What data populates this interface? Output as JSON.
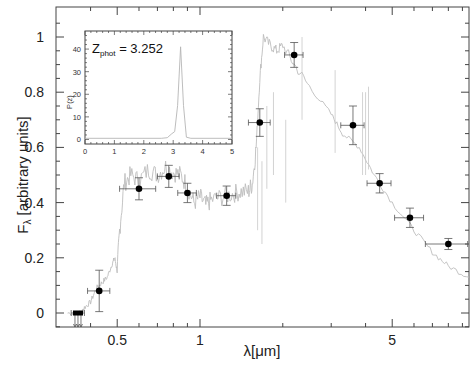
{
  "chart_data": {
    "type": "scatter",
    "title": "",
    "xlabel": "λ[μm]",
    "ylabel": "Fλ [arbitrary units]",
    "xscale": "log",
    "xlim": [
      0.3,
      9.5
    ],
    "ylim": [
      -0.05,
      1.08
    ],
    "x_ticks": [
      0.5,
      1,
      5
    ],
    "x_tick_labels": [
      "0.5",
      "1",
      "5"
    ],
    "y_ticks": [
      0,
      0.2,
      0.4,
      0.6,
      0.8,
      1
    ],
    "y_tick_labels": [
      "0",
      "0.2",
      "0.4",
      "0.6",
      "0.8",
      "1"
    ],
    "grid": false,
    "series": [
      {
        "name": "photometry",
        "style": "black points with error bars",
        "points": [
          {
            "x": 0.36,
            "y": 0.0,
            "xerr": 0.02,
            "yerr": 0.0,
            "upper_limit": true
          },
          {
            "x": 0.43,
            "y": 0.08,
            "xerr": 0.04,
            "yerr": 0.075
          },
          {
            "x": 0.6,
            "y": 0.45,
            "xerr": 0.09,
            "yerr": 0.04
          },
          {
            "x": 0.77,
            "y": 0.495,
            "xerr": 0.07,
            "yerr": 0.04
          },
          {
            "x": 0.9,
            "y": 0.435,
            "xerr": 0.07,
            "yerr": 0.035
          },
          {
            "x": 1.25,
            "y": 0.425,
            "xerr": 0.1,
            "yerr": 0.035
          },
          {
            "x": 1.65,
            "y": 0.69,
            "xerr": 0.15,
            "yerr": 0.05
          },
          {
            "x": 2.2,
            "y": 0.935,
            "xerr": 0.17,
            "yerr": 0.045
          },
          {
            "x": 3.6,
            "y": 0.68,
            "xerr": 0.35,
            "yerr": 0.07
          },
          {
            "x": 4.5,
            "y": 0.47,
            "xerr": 0.45,
            "yerr": 0.035
          },
          {
            "x": 5.8,
            "y": 0.345,
            "xerr": 0.7,
            "yerr": 0.035
          },
          {
            "x": 8.0,
            "y": 0.25,
            "xerr": 1.4,
            "yerr": 0.02
          }
        ]
      },
      {
        "name": "best-fit template spectrum",
        "style": "light gray line",
        "points": [
          [
            0.33,
            0.0
          ],
          [
            0.37,
            0.0
          ],
          [
            0.38,
            0.02
          ],
          [
            0.4,
            0.04
          ],
          [
            0.42,
            0.09
          ],
          [
            0.44,
            0.11
          ],
          [
            0.46,
            0.13
          ],
          [
            0.48,
            0.18
          ],
          [
            0.49,
            0.2
          ],
          [
            0.5,
            0.15
          ],
          [
            0.51,
            0.3
          ],
          [
            0.53,
            0.47
          ],
          [
            0.56,
            0.5
          ],
          [
            0.6,
            0.48
          ],
          [
            0.65,
            0.52
          ],
          [
            0.7,
            0.5
          ],
          [
            0.75,
            0.53
          ],
          [
            0.8,
            0.51
          ],
          [
            0.85,
            0.5
          ],
          [
            0.9,
            0.46
          ],
          [
            0.95,
            0.4
          ],
          [
            1.0,
            0.42
          ],
          [
            1.05,
            0.39
          ],
          [
            1.1,
            0.41
          ],
          [
            1.2,
            0.42
          ],
          [
            1.3,
            0.43
          ],
          [
            1.4,
            0.44
          ],
          [
            1.5,
            0.44
          ],
          [
            1.55,
            0.47
          ],
          [
            1.6,
            0.6
          ],
          [
            1.65,
            0.85
          ],
          [
            1.7,
            1.0
          ],
          [
            1.8,
            0.97
          ],
          [
            1.9,
            0.95
          ],
          [
            2.0,
            0.97
          ],
          [
            2.2,
            0.9
          ],
          [
            2.5,
            0.82
          ],
          [
            3.0,
            0.72
          ],
          [
            3.3,
            0.65
          ],
          [
            3.8,
            0.6
          ],
          [
            4.3,
            0.5
          ],
          [
            5.0,
            0.4
          ],
          [
            6.0,
            0.3
          ],
          [
            7.0,
            0.22
          ],
          [
            8.0,
            0.17
          ],
          [
            9.5,
            0.13
          ]
        ]
      }
    ],
    "annotations": [],
    "inset": {
      "type": "line",
      "label_text": "Z",
      "label_sub": "phot",
      "label_value": "= 3.252",
      "ylabel": "P(z)",
      "xlim": [
        0,
        5
      ],
      "ylim": [
        -2,
        48
      ],
      "x_ticks": [
        0,
        1,
        2,
        3,
        4,
        5
      ],
      "x_tick_labels": [
        "0",
        "1",
        "2",
        "3",
        "4",
        "5"
      ],
      "y_ticks": [
        0,
        10,
        20,
        30,
        40
      ],
      "y_tick_labels": [
        "0",
        "10",
        "20",
        "30",
        "40"
      ],
      "series": [
        {
          "name": "P(z)",
          "points": [
            [
              0,
              0.5
            ],
            [
              2.6,
              0.5
            ],
            [
              2.8,
              0.8
            ],
            [
              2.95,
              2.5
            ],
            [
              3.05,
              3.5
            ],
            [
              3.15,
              15
            ],
            [
              3.25,
              41
            ],
            [
              3.35,
              15
            ],
            [
              3.45,
              1
            ],
            [
              3.6,
              0.5
            ],
            [
              5,
              0.5
            ]
          ]
        }
      ]
    }
  },
  "labels": {
    "ylabel_main": "F",
    "ylabel_sub": "λ",
    "ylabel_rest": " [arbitrary units]",
    "xlabel": "λ[μm]",
    "inset_z": "Z",
    "inset_sub": "phot",
    "inset_value": " = 3.252",
    "inset_ylabel": "P(z)"
  }
}
